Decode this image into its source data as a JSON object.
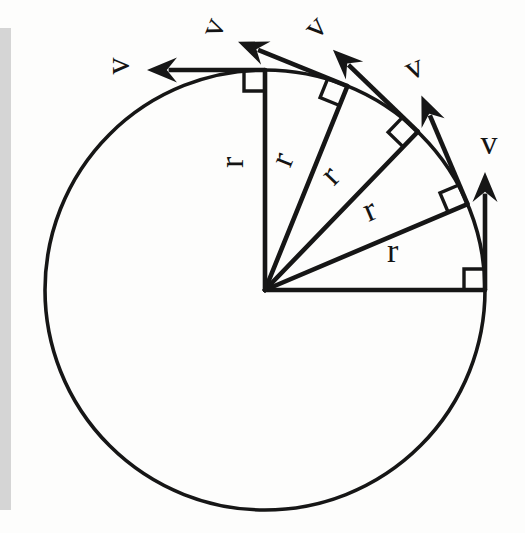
{
  "figure": {
    "kind": "physics-vector-diagram",
    "canvas": {
      "width": 525,
      "height": 533,
      "background": "#fdfdfc"
    },
    "ink_color": "#161616",
    "scan_strip": {
      "name": "page-edge-shadow",
      "color": "#c9c9c9",
      "x": 0,
      "y": 28,
      "width": 11,
      "height": 482
    },
    "circle": {
      "label": "trajectory-circle",
      "center_x": 265,
      "center_y": 290,
      "radius": 220,
      "stroke_width": 3.6
    },
    "radii": [
      {
        "id": "radius-0",
        "label": "r",
        "angle_deg": 0,
        "label_offset": 36,
        "label_side": -1
      },
      {
        "id": "radius-22",
        "label": "r",
        "angle_deg": 23,
        "label_offset": 30,
        "label_side": -1
      },
      {
        "id": "radius-45",
        "label": "r",
        "angle_deg": 46,
        "label_offset": 30,
        "label_side": -1
      },
      {
        "id": "radius-67",
        "label": "r",
        "angle_deg": 68,
        "label_offset": 30,
        "label_side": -1
      },
      {
        "id": "radius-90",
        "label": "r",
        "angle_deg": 90,
        "label_offset": 30,
        "label_side": -1
      }
    ],
    "velocities": [
      {
        "id": "velocity-0",
        "label": "v",
        "at_angle_deg": 0,
        "length": 118,
        "label_rotation_deg": 0,
        "label_gap": 26
      },
      {
        "id": "velocity-22",
        "label": "v",
        "at_angle_deg": 23,
        "length": 118,
        "label_rotation_deg": -23,
        "label_gap": 26
      },
      {
        "id": "velocity-45",
        "label": "v",
        "at_angle_deg": 46,
        "length": 118,
        "label_rotation_deg": -46,
        "label_gap": 26
      },
      {
        "id": "velocity-67",
        "label": "v",
        "at_angle_deg": 68,
        "length": 118,
        "label_rotation_deg": -68,
        "label_gap": 26
      },
      {
        "id": "velocity-90",
        "label": "v",
        "at_angle_deg": 90,
        "length": 118,
        "label_rotation_deg": -90,
        "label_gap": 26
      }
    ],
    "right_angle_marks": [
      {
        "id": "right-angle-0",
        "at_angle_deg": 0,
        "size": 21
      },
      {
        "id": "right-angle-22",
        "at_angle_deg": 23,
        "size": 21
      },
      {
        "id": "right-angle-45",
        "at_angle_deg": 46,
        "size": 21
      },
      {
        "id": "right-angle-67",
        "at_angle_deg": 68,
        "size": 21
      },
      {
        "id": "right-angle-90",
        "at_angle_deg": 90,
        "size": 21
      }
    ],
    "arrow_head": {
      "length": 30,
      "half_width": 12.5
    },
    "labels": {
      "radius_symbol": "r",
      "velocity_symbol": "v"
    }
  }
}
